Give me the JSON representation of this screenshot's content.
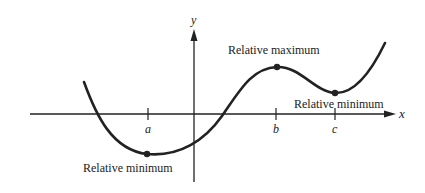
{
  "diagram": {
    "type": "function-graph",
    "axes": {
      "x_label": "x",
      "y_label": "y"
    },
    "ticks": [
      {
        "label": "a"
      },
      {
        "label": "b"
      },
      {
        "label": "c"
      }
    ],
    "annotations": [
      {
        "label": "Relative minimum",
        "at": "a"
      },
      {
        "label": "Relative maximum",
        "at": "b"
      },
      {
        "label": "Relative minimum",
        "at": "c"
      }
    ],
    "colors": {
      "stroke": "#222222",
      "background": "#ffffff"
    }
  }
}
